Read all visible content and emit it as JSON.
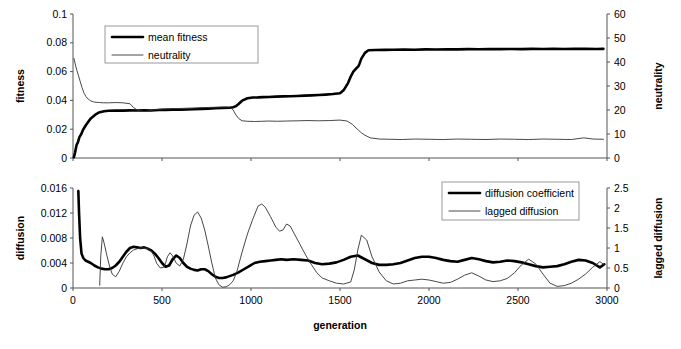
{
  "figure": {
    "title": "",
    "background": "#ffffff",
    "width": 681,
    "height": 349
  },
  "chart_data": [
    {
      "id": "top",
      "type": "line",
      "title": "",
      "xlabel": "",
      "ylabel": "fitness",
      "y2label": "neutrality",
      "xlim": [
        0,
        3000
      ],
      "ylim": [
        0,
        0.1
      ],
      "y2lim": [
        0,
        60
      ],
      "grid": false,
      "legend_position": "top-left",
      "xticks": [
        0,
        500,
        1000,
        1500,
        2000,
        2500,
        3000
      ],
      "xticklabels": [
        "0",
        "500",
        "1000",
        "1500",
        "2000",
        "2500",
        "3000"
      ],
      "xticklabels_visible": false,
      "yticks": [
        0,
        0.02,
        0.04,
        0.06,
        0.08,
        0.1
      ],
      "yticklabels": [
        "0",
        "0.02",
        "0.04",
        "0.06",
        "0.08",
        "0.1"
      ],
      "y2ticks": [
        0,
        10,
        20,
        30,
        40,
        50,
        60
      ],
      "y2ticklabels": [
        "0",
        "10",
        "20",
        "30",
        "40",
        "50",
        "60"
      ],
      "series": [
        {
          "name": "mean fitness",
          "axis": "left",
          "style": "thick",
          "color": "#000000",
          "x": [
            5,
            12,
            20,
            28,
            36,
            46,
            56,
            66,
            76,
            88,
            100,
            115,
            130,
            150,
            175,
            200,
            240,
            280,
            320,
            360,
            400,
            440,
            480,
            520,
            560,
            600,
            640,
            680,
            720,
            760,
            800,
            840,
            880,
            900,
            915,
            930,
            950,
            980,
            1010,
            1040,
            1070,
            1100,
            1140,
            1180,
            1220,
            1260,
            1300,
            1340,
            1380,
            1420,
            1460,
            1500,
            1520,
            1545,
            1560,
            1575,
            1590,
            1605,
            1620,
            1640,
            1660,
            1700,
            1750,
            1800,
            1860,
            1920,
            1980,
            2040,
            2100,
            2160,
            2220,
            2280,
            2340,
            2400,
            2460,
            2520,
            2580,
            2640,
            2700,
            2760,
            2820,
            2880,
            2940,
            2980
          ],
          "y": [
            0.0005,
            0.004,
            0.009,
            0.011,
            0.0145,
            0.0165,
            0.0195,
            0.0215,
            0.0235,
            0.0255,
            0.0275,
            0.029,
            0.0305,
            0.0318,
            0.0325,
            0.0328,
            0.033,
            0.0329,
            0.0331,
            0.033,
            0.0332,
            0.033,
            0.0333,
            0.0334,
            0.0336,
            0.0335,
            0.0337,
            0.0339,
            0.0341,
            0.0343,
            0.0345,
            0.0347,
            0.0349,
            0.0352,
            0.036,
            0.0375,
            0.0398,
            0.0415,
            0.042,
            0.0421,
            0.0423,
            0.0424,
            0.0426,
            0.0428,
            0.0429,
            0.0431,
            0.0433,
            0.0435,
            0.0437,
            0.044,
            0.0444,
            0.045,
            0.047,
            0.052,
            0.0565,
            0.06,
            0.062,
            0.064,
            0.069,
            0.073,
            0.0748,
            0.075,
            0.0751,
            0.0752,
            0.0753,
            0.0752,
            0.0754,
            0.0753,
            0.0755,
            0.0754,
            0.0756,
            0.0755,
            0.0757,
            0.0756,
            0.0757,
            0.0756,
            0.0758,
            0.0757,
            0.0758,
            0.0757,
            0.0759,
            0.0758,
            0.0757,
            0.0758
          ]
        },
        {
          "name": "neutrality",
          "axis": "right",
          "style": "thin",
          "color": "#333333",
          "x": [
            5,
            10,
            16,
            22,
            30,
            40,
            50,
            62,
            74,
            86,
            100,
            115,
            130,
            150,
            170,
            200,
            240,
            280,
            320,
            340,
            360,
            380,
            400,
            420,
            440,
            470,
            500,
            540,
            580,
            620,
            660,
            700,
            740,
            780,
            820,
            860,
            880,
            900,
            915,
            930,
            950,
            980,
            1020,
            1060,
            1100,
            1150,
            1200,
            1260,
            1320,
            1380,
            1440,
            1500,
            1540,
            1570,
            1590,
            1605,
            1620,
            1640,
            1670,
            1720,
            1780,
            1850,
            1920,
            2000,
            2080,
            2160,
            2240,
            2320,
            2400,
            2480,
            2560,
            2640,
            2720,
            2800,
            2870,
            2920,
            2980
          ],
          "y": [
            41.5,
            40.0,
            38.0,
            36.5,
            34.5,
            32.0,
            29.5,
            27.0,
            25.5,
            24.5,
            23.8,
            23.4,
            23.2,
            23.1,
            23.0,
            23.0,
            23.1,
            23.0,
            22.6,
            21.0,
            20.0,
            19.6,
            19.4,
            19.5,
            19.8,
            20.2,
            20.4,
            20.5,
            20.6,
            20.7,
            20.8,
            20.9,
            21.0,
            21.1,
            21.2,
            21.3,
            21.2,
            20.0,
            18.0,
            16.5,
            15.5,
            15.3,
            15.2,
            15.3,
            15.4,
            15.3,
            15.4,
            15.5,
            15.6,
            15.5,
            15.6,
            15.8,
            15.4,
            14.0,
            12.5,
            11.5,
            10.5,
            9.5,
            8.4,
            7.9,
            7.8,
            7.7,
            7.9,
            7.8,
            7.7,
            7.9,
            7.8,
            7.7,
            7.9,
            7.8,
            7.7,
            7.9,
            7.8,
            7.7,
            8.4,
            7.9,
            7.8
          ]
        }
      ]
    },
    {
      "id": "bottom",
      "type": "line",
      "title": "",
      "xlabel": "generation",
      "ylabel": "diffusion",
      "y2label": "lagged diffusion",
      "xlim": [
        0,
        3000
      ],
      "ylim": [
        0,
        0.016
      ],
      "y2lim": [
        0,
        2.5
      ],
      "grid": false,
      "legend_position": "top-right",
      "xticks": [
        0,
        500,
        1000,
        1500,
        2000,
        2500,
        3000
      ],
      "xticklabels": [
        "0",
        "500",
        "1000",
        "1500",
        "2000",
        "2500",
        "3000"
      ],
      "xticklabels_visible": true,
      "yticks": [
        0,
        0.004,
        0.008,
        0.012,
        0.016
      ],
      "yticklabels": [
        "0",
        "0.004",
        "0.008",
        "0.012",
        "0.016"
      ],
      "y2ticks": [
        0,
        0.5,
        1,
        1.5,
        2,
        2.5
      ],
      "y2ticklabels": [
        "0",
        "0.5",
        "1",
        "1.5",
        "2",
        "2.5"
      ],
      "series": [
        {
          "name": "diffusion coefficient",
          "axis": "left",
          "style": "thick",
          "color": "#000000",
          "x": [
            30,
            34,
            40,
            48,
            58,
            70,
            85,
            100,
            120,
            140,
            160,
            180,
            200,
            220,
            240,
            260,
            280,
            300,
            320,
            340,
            360,
            380,
            400,
            420,
            440,
            460,
            480,
            500,
            520,
            540,
            560,
            580,
            600,
            620,
            640,
            660,
            680,
            700,
            720,
            740,
            760,
            780,
            800,
            820,
            840,
            860,
            880,
            900,
            930,
            960,
            990,
            1020,
            1050,
            1080,
            1110,
            1140,
            1170,
            1200,
            1240,
            1280,
            1320,
            1360,
            1400,
            1440,
            1480,
            1520,
            1560,
            1600,
            1640,
            1680,
            1720,
            1760,
            1800,
            1840,
            1880,
            1920,
            1960,
            2000,
            2040,
            2080,
            2120,
            2160,
            2200,
            2240,
            2280,
            2320,
            2360,
            2400,
            2440,
            2480,
            2520,
            2560,
            2600,
            2640,
            2680,
            2720,
            2760,
            2800,
            2840,
            2880,
            2920,
            2960,
            2985
          ],
          "y": [
            0.0155,
            0.012,
            0.008,
            0.0055,
            0.0048,
            0.0044,
            0.0042,
            0.004,
            0.0036,
            0.0033,
            0.0031,
            0.003,
            0.003,
            0.0032,
            0.0036,
            0.0042,
            0.005,
            0.0058,
            0.0064,
            0.0066,
            0.0065,
            0.0064,
            0.0065,
            0.0063,
            0.006,
            0.0055,
            0.0048,
            0.004,
            0.0034,
            0.0036,
            0.0046,
            0.0052,
            0.0048,
            0.004,
            0.0034,
            0.0031,
            0.0029,
            0.0028,
            0.003,
            0.003,
            0.0027,
            0.0022,
            0.0018,
            0.0016,
            0.0016,
            0.0017,
            0.0019,
            0.0021,
            0.0025,
            0.003,
            0.0035,
            0.004,
            0.0042,
            0.0043,
            0.0044,
            0.0045,
            0.0046,
            0.0045,
            0.0046,
            0.0045,
            0.0044,
            0.004,
            0.0038,
            0.0039,
            0.0041,
            0.0045,
            0.005,
            0.0052,
            0.0046,
            0.004,
            0.0037,
            0.0037,
            0.0038,
            0.004,
            0.0044,
            0.0048,
            0.005,
            0.005,
            0.0048,
            0.0045,
            0.0043,
            0.0042,
            0.0045,
            0.0048,
            0.0046,
            0.0043,
            0.0041,
            0.0042,
            0.0044,
            0.0043,
            0.0041,
            0.0038,
            0.0035,
            0.0033,
            0.0034,
            0.0035,
            0.0038,
            0.0042,
            0.0045,
            0.0044,
            0.004,
            0.0033,
            0.0038
          ]
        },
        {
          "name": "lagged diffusion",
          "axis": "right",
          "style": "thin",
          "color": "#333333",
          "x": [
            150,
            156,
            165,
            175,
            190,
            205,
            220,
            240,
            260,
            280,
            300,
            320,
            340,
            360,
            380,
            400,
            420,
            430,
            440,
            455,
            470,
            490,
            510,
            520,
            530,
            545,
            560,
            580,
            600,
            620,
            640,
            660,
            680,
            700,
            720,
            740,
            760,
            780,
            800,
            820,
            840,
            860,
            880,
            900,
            920,
            950,
            980,
            1010,
            1040,
            1060,
            1080,
            1110,
            1140,
            1160,
            1180,
            1200,
            1220,
            1250,
            1280,
            1310,
            1340,
            1370,
            1400,
            1440,
            1480,
            1520,
            1560,
            1580,
            1600,
            1620,
            1650,
            1680,
            1720,
            1760,
            1800,
            1840,
            1880,
            1920,
            1960,
            2000,
            2040,
            2080,
            2120,
            2160,
            2200,
            2240,
            2280,
            2320,
            2360,
            2400,
            2440,
            2480,
            2520,
            2560,
            2600,
            2640,
            2680,
            2720,
            2760,
            2800,
            2840,
            2880,
            2920,
            2960,
            2985
          ],
          "y": [
            0.07,
            0.8,
            1.28,
            1.12,
            0.82,
            0.55,
            0.35,
            0.28,
            0.42,
            0.62,
            0.78,
            0.88,
            0.95,
            0.98,
            1.0,
            1.0,
            0.98,
            0.97,
            0.93,
            0.8,
            0.62,
            0.5,
            0.52,
            0.62,
            0.78,
            0.88,
            0.8,
            0.62,
            0.55,
            0.72,
            1.1,
            1.55,
            1.82,
            1.9,
            1.75,
            1.45,
            1.05,
            0.62,
            0.25,
            0.08,
            0.02,
            0.03,
            0.08,
            0.18,
            0.4,
            0.9,
            1.35,
            1.72,
            2.05,
            2.1,
            2.02,
            1.78,
            1.52,
            1.42,
            1.45,
            1.6,
            1.55,
            1.3,
            1.05,
            0.8,
            0.58,
            0.38,
            0.25,
            0.18,
            0.12,
            0.1,
            0.15,
            0.45,
            0.95,
            1.32,
            1.2,
            0.78,
            0.4,
            0.18,
            0.1,
            0.12,
            0.18,
            0.2,
            0.22,
            0.2,
            0.16,
            0.12,
            0.14,
            0.22,
            0.32,
            0.38,
            0.3,
            0.2,
            0.16,
            0.18,
            0.24,
            0.38,
            0.58,
            0.72,
            0.6,
            0.35,
            0.12,
            0.04,
            0.06,
            0.12,
            0.22,
            0.35,
            0.52,
            0.66,
            0.58,
            0.35,
            0.48
          ]
        }
      ]
    }
  ]
}
